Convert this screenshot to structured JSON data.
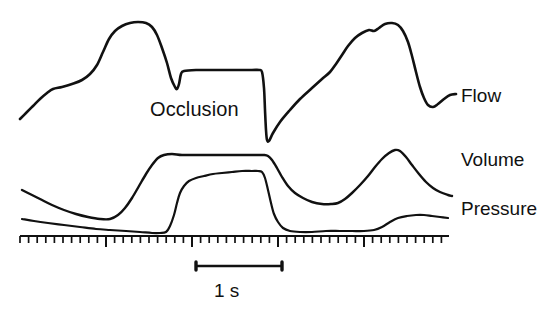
{
  "figure": {
    "background_color": "#ffffff",
    "ink_color": "#111111",
    "width": 552,
    "height": 315
  },
  "annotations": {
    "occlusion_label": "Occlusion",
    "flow_label": "Flow",
    "volume_label": "Volume",
    "pressure_label": "Pressure",
    "scale_label": "1 s"
  },
  "scale_bar": {
    "label": "1 s",
    "x_start": 196,
    "x_end": 282,
    "y": 266,
    "seconds": 1
  },
  "time_ruler": {
    "x_start": 20,
    "x_end": 449,
    "baseline_y": 236,
    "tick_spacing_px": 8.6,
    "minor_tick_height": 7,
    "major_tick_height": 11,
    "major_tick_every": 10
  },
  "chart_data": {
    "type": "line",
    "xlabel": "Time",
    "ylabel": "",
    "grid": false,
    "legend": "right-inline",
    "xlim": [
      0,
      552
    ],
    "ylim": [
      315,
      0
    ],
    "axis_note": "Pixel coordinates of the hand-drawn tracings; y increases downward",
    "annotations": [
      {
        "text": "Occlusion",
        "x": 150,
        "y": 110
      },
      {
        "text": "1 s",
        "x": 239,
        "y": 290
      }
    ],
    "series": [
      {
        "name": "Flow",
        "label": "Flow",
        "label_x": 461,
        "label_y": 95,
        "color": "#111111",
        "points": [
          [
            20,
            119
          ],
          [
            26,
            113
          ],
          [
            33,
            106
          ],
          [
            40,
            99
          ],
          [
            47,
            93
          ],
          [
            53,
            89
          ],
          [
            62,
            87
          ],
          [
            72,
            84
          ],
          [
            82,
            80
          ],
          [
            90,
            74
          ],
          [
            97,
            65
          ],
          [
            103,
            52
          ],
          [
            109,
            39
          ],
          [
            115,
            31
          ],
          [
            122,
            26
          ],
          [
            130,
            23
          ],
          [
            138,
            22
          ],
          [
            146,
            23
          ],
          [
            152,
            27
          ],
          [
            157,
            35
          ],
          [
            162,
            48
          ],
          [
            167,
            63
          ],
          [
            171,
            78
          ],
          [
            175,
            87
          ],
          [
            177,
            89
          ],
          [
            179,
            84
          ],
          [
            181,
            74
          ],
          [
            184,
            71
          ],
          [
            196,
            70
          ],
          [
            214,
            70
          ],
          [
            236,
            70
          ],
          [
            252,
            70
          ],
          [
            259,
            70
          ],
          [
            262,
            72
          ],
          [
            264,
            88
          ],
          [
            265,
            110
          ],
          [
            266,
            130
          ],
          [
            267,
            140
          ],
          [
            269,
            141
          ],
          [
            273,
            133
          ],
          [
            280,
            122
          ],
          [
            290,
            110
          ],
          [
            300,
            99
          ],
          [
            312,
            88
          ],
          [
            322,
            79
          ],
          [
            330,
            72
          ],
          [
            336,
            64
          ],
          [
            342,
            55
          ],
          [
            348,
            46
          ],
          [
            355,
            38
          ],
          [
            362,
            33
          ],
          [
            369,
            30
          ],
          [
            374,
            31
          ],
          [
            379,
            28
          ],
          [
            385,
            24
          ],
          [
            392,
            23
          ],
          [
            398,
            25
          ],
          [
            403,
            31
          ],
          [
            408,
            42
          ],
          [
            412,
            56
          ],
          [
            416,
            72
          ],
          [
            420,
            87
          ],
          [
            424,
            98
          ],
          [
            428,
            105
          ],
          [
            433,
            107
          ],
          [
            438,
            104
          ],
          [
            444,
            99
          ],
          [
            450,
            95
          ],
          [
            456,
            94
          ]
        ]
      },
      {
        "name": "Volume",
        "label": "Volume",
        "label_x": 461,
        "label_y": 160,
        "color": "#111111",
        "points": [
          [
            22,
            190
          ],
          [
            30,
            194
          ],
          [
            40,
            199
          ],
          [
            52,
            205
          ],
          [
            64,
            210
          ],
          [
            76,
            214
          ],
          [
            88,
            217
          ],
          [
            100,
            219
          ],
          [
            110,
            219
          ],
          [
            118,
            215
          ],
          [
            125,
            208
          ],
          [
            132,
            198
          ],
          [
            139,
            186
          ],
          [
            146,
            174
          ],
          [
            152,
            165
          ],
          [
            158,
            158
          ],
          [
            164,
            155
          ],
          [
            172,
            154
          ],
          [
            182,
            155
          ],
          [
            196,
            155
          ],
          [
            212,
            155
          ],
          [
            228,
            155
          ],
          [
            244,
            155
          ],
          [
            256,
            155
          ],
          [
            264,
            155
          ],
          [
            268,
            156
          ],
          [
            272,
            160
          ],
          [
            277,
            168
          ],
          [
            282,
            177
          ],
          [
            288,
            186
          ],
          [
            295,
            193
          ],
          [
            303,
            198
          ],
          [
            312,
            202
          ],
          [
            322,
            204
          ],
          [
            331,
            204
          ],
          [
            338,
            203
          ],
          [
            345,
            199
          ],
          [
            352,
            193
          ],
          [
            360,
            185
          ],
          [
            368,
            176
          ],
          [
            375,
            167
          ],
          [
            382,
            159
          ],
          [
            389,
            153
          ],
          [
            395,
            150
          ],
          [
            400,
            151
          ],
          [
            406,
            157
          ],
          [
            412,
            165
          ],
          [
            419,
            174
          ],
          [
            426,
            182
          ],
          [
            433,
            188
          ],
          [
            440,
            192
          ],
          [
            448,
            195
          ],
          [
            452,
            196
          ]
        ]
      },
      {
        "name": "Pressure",
        "label": "Pressure",
        "label_x": 461,
        "label_y": 208,
        "color": "#111111",
        "points": [
          [
            22,
            219
          ],
          [
            34,
            221
          ],
          [
            48,
            223
          ],
          [
            64,
            225
          ],
          [
            80,
            227
          ],
          [
            96,
            229
          ],
          [
            110,
            230
          ],
          [
            126,
            231
          ],
          [
            140,
            232
          ],
          [
            152,
            233
          ],
          [
            160,
            233
          ],
          [
            166,
            232
          ],
          [
            170,
            226
          ],
          [
            174,
            215
          ],
          [
            177,
            203
          ],
          [
            180,
            193
          ],
          [
            184,
            186
          ],
          [
            189,
            181
          ],
          [
            196,
            178
          ],
          [
            204,
            176
          ],
          [
            213,
            174
          ],
          [
            222,
            173
          ],
          [
            232,
            172
          ],
          [
            242,
            171
          ],
          [
            252,
            171
          ],
          [
            258,
            171
          ],
          [
            262,
            172
          ],
          [
            265,
            178
          ],
          [
            268,
            190
          ],
          [
            271,
            203
          ],
          [
            274,
            214
          ],
          [
            278,
            222
          ],
          [
            283,
            228
          ],
          [
            290,
            231
          ],
          [
            300,
            232
          ],
          [
            312,
            232
          ],
          [
            326,
            231
          ],
          [
            340,
            231
          ],
          [
            352,
            231
          ],
          [
            364,
            231
          ],
          [
            374,
            230
          ],
          [
            382,
            227
          ],
          [
            390,
            222
          ],
          [
            398,
            218
          ],
          [
            407,
            216
          ],
          [
            416,
            215
          ],
          [
            424,
            215
          ],
          [
            432,
            216
          ],
          [
            440,
            217
          ],
          [
            448,
            218
          ]
        ]
      }
    ]
  }
}
